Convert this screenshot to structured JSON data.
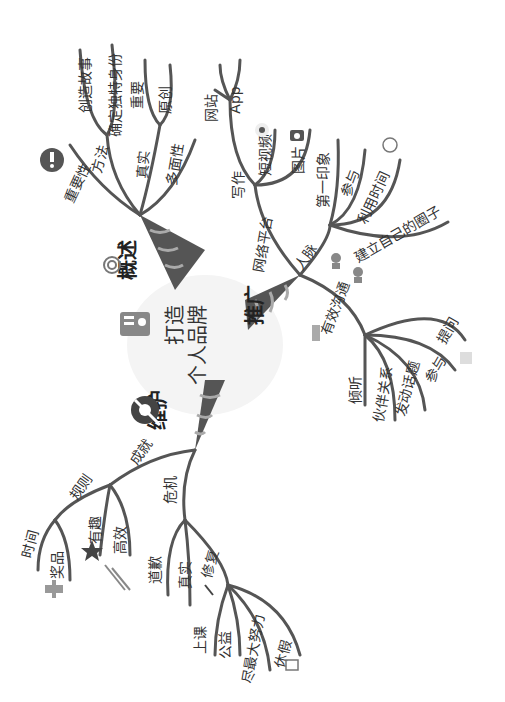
{
  "center": {
    "line1": "打造",
    "line2": "个人品牌",
    "line1b": "品牌",
    "line2a": "个人"
  },
  "branches": {
    "overview": {
      "label": "概述",
      "children": {
        "importance": "重要性",
        "method": "方法",
        "method_children": [
          "创造故事",
          "确定独特身份"
        ],
        "authentic": "真实",
        "authentic_children": [
          "重要",
          "原创"
        ],
        "multifaceted": "多面性"
      }
    },
    "promote": {
      "label": "推广",
      "children": {
        "network": "网络平台",
        "network_children": {
          "writing": "写作",
          "writing_children": [
            "网站",
            "App"
          ],
          "video": "短视频",
          "photo": "图片"
        },
        "connections": "人脉",
        "connections_children": [
          "第一印象",
          "参与",
          "利用时间",
          "建立自己的圈子"
        ],
        "communication": "有效沟通",
        "communication_children": [
          "倾听",
          "伙伴关系",
          "发动话题",
          "参与",
          "提问"
        ]
      }
    },
    "maintain": {
      "label": "维护",
      "children": {
        "achievement": "成就",
        "achievement_children": {
          "rules": "规则",
          "rules_children": [
            "时间",
            "奖品"
          ],
          "fun": "有趣",
          "efficient": "高效"
        },
        "crisis": "危机",
        "crisis_children": {
          "apology": "道歉",
          "truth": "真实",
          "repair": "修复",
          "repair_children": [
            "上课",
            "公益",
            "尽最大努力",
            "休假"
          ]
        }
      }
    }
  },
  "colors": {
    "branch": "#555555",
    "ribbon_dark": "#4a4a4a",
    "ribbon_light": "#8a8a8a",
    "icon": "#666666"
  }
}
